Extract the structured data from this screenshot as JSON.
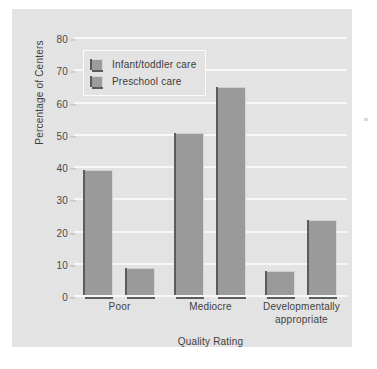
{
  "chart_data": {
    "type": "bar",
    "title": "",
    "categories": [
      "Poor",
      "Mediocre",
      "Developmentally appropriate"
    ],
    "series": [
      {
        "name": "Infant/toddler care",
        "values": [
          39.5,
          51,
          8
        ]
      },
      {
        "name": "Preschool care",
        "values": [
          9,
          65,
          24
        ]
      }
    ],
    "xlabel": "Quality Rating",
    "ylabel": "Percentage of Centers",
    "ylim": [
      0,
      80
    ],
    "yticks": [
      0,
      10,
      20,
      30,
      40,
      50,
      60,
      70,
      80
    ],
    "ytick_labels": [
      "0",
      "10",
      "20",
      "30",
      "40",
      "50",
      "60",
      "70",
      "80"
    ],
    "grid": true,
    "legend_position": "upper left",
    "colors": {
      "bar_fill": "#9a9a9a",
      "bar_shadow": "#5c5c5c",
      "panel_background": "#e3e3e3",
      "gridline": "#f7f7f7",
      "text": "#3f3f3f"
    }
  }
}
